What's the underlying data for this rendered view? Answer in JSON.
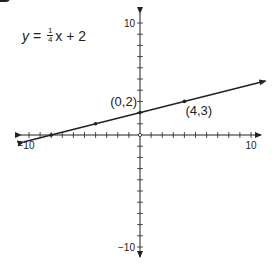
{
  "equation": {
    "lhs": "y",
    "eq": "=",
    "frac_num": "1",
    "frac_den": "4",
    "var": "x",
    "rest": "+ 2"
  },
  "chart_data": {
    "type": "line",
    "xlabel": "",
    "ylabel": "",
    "xlim": [
      -10,
      10
    ],
    "ylim": [
      -10,
      10
    ],
    "x_tick_step": 1,
    "y_tick_step": 1,
    "x_tick_labels": [
      "-10",
      "10"
    ],
    "y_tick_labels": [
      "10",
      "-10"
    ],
    "grid": false,
    "series": [
      {
        "name": "y = 1/4x + 2",
        "slope": 0.25,
        "intercept": 2,
        "x": [
          -10.5,
          11.3
        ],
        "y": [
          -0.625,
          4.825
        ],
        "arrows": "both"
      }
    ],
    "points": [
      {
        "x": 0,
        "y": 2,
        "label": "(0,2)"
      },
      {
        "x": 4,
        "y": 3,
        "label": "(4,3)"
      },
      {
        "x": -4,
        "y": 1,
        "label": ""
      },
      {
        "x": -8,
        "y": 0,
        "label": ""
      }
    ]
  },
  "labels": {
    "x_min": "−10",
    "x_max": "10",
    "y_max": "10",
    "y_min": "−10",
    "pt_a": "(0,2)",
    "pt_b": "(4,3)"
  },
  "colors": {
    "ink": "#222222",
    "background": "#ffffff"
  }
}
